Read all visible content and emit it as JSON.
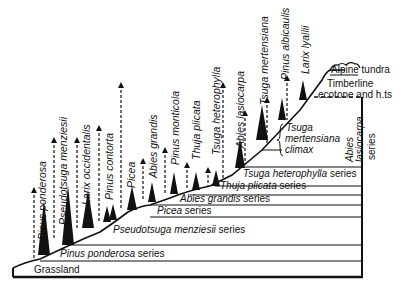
{
  "diagram": {
    "type": "vegetation zonation cross-section",
    "colors": {
      "ink": "#111111",
      "background": "#ffffff"
    },
    "species_labels": [
      {
        "name": "Pinus ponderosa",
        "x": 44,
        "y_base": 250,
        "arrow_top": 190
      },
      {
        "name": "Pseudotsuga menziesii",
        "x": 64,
        "y_base": 235,
        "arrow_top": 140
      },
      {
        "name": "Larix occidentalis",
        "x": 88,
        "y_base": 215,
        "arrow_top": 128
      },
      {
        "name": "Pinus contorta",
        "x": 111,
        "y_base": 205,
        "arrow_top": 85
      },
      {
        "name": "Picea",
        "x": 132,
        "y_base": 192,
        "arrow_top": 161
      },
      {
        "name": "Abies grandis",
        "x": 152,
        "y_base": 186,
        "arrow_top": 151
      },
      {
        "name": "Pinus monticola",
        "x": 173,
        "y_base": 178,
        "arrow_top": 133
      },
      {
        "name": "Thuja plicata",
        "x": 193,
        "y_base": 175,
        "arrow_top": 170
      },
      {
        "name": "Tsuga heterophylla",
        "x": 214,
        "y_base": 171,
        "arrow_top": 150
      },
      {
        "name": "Abies lasiocarpa",
        "x": 236,
        "y_base": 163,
        "arrow_top": 85
      },
      {
        "name": "Tsuga mertensiana",
        "x": 258,
        "y_base": 140,
        "arrow_top": 113
      },
      {
        "name": "Pinus albicaulis",
        "x": 278,
        "y_base": 112,
        "arrow_top": 78
      },
      {
        "name": "Larix lyallii",
        "x": 298,
        "y_base": 97,
        "arrow_top": 76
      }
    ],
    "series_labels": [
      {
        "text_italic": "Pinus ponderosa",
        "text_plain": " series",
        "x": 60,
        "y": 255
      },
      {
        "text_italic": "Pseudotsuga menziesii",
        "text_plain": " series",
        "x": 112,
        "y": 231
      },
      {
        "text_italic": "Picea",
        "text_plain": " series",
        "x": 157,
        "y": 211
      },
      {
        "text_italic": "Abies grandis",
        "text_plain": " series",
        "x": 175,
        "y": 199
      },
      {
        "text_italic": "Thuja plicata",
        "text_plain": " series",
        "x": 220,
        "y": 187
      },
      {
        "text_italic": "Tsuga heterophylla",
        "text_plain": " series",
        "x": 242,
        "y": 176
      }
    ],
    "zone_labels": {
      "grassland": "Grassland",
      "alpine_tundra": "Alpine tundra",
      "timberline_line1": "Timberline",
      "timberline_line2": "ecotone and h.ts",
      "tsuga_climax_line1": "Tsuga",
      "tsuga_climax_line2": "mertensiana",
      "tsuga_climax_line3": "climax",
      "abies_lasiocarpa_series_line1": "Abies",
      "abies_lasiocarpa_series_line2": "lasiocarpa",
      "abies_lasiocarpa_series_line3": "series"
    }
  }
}
